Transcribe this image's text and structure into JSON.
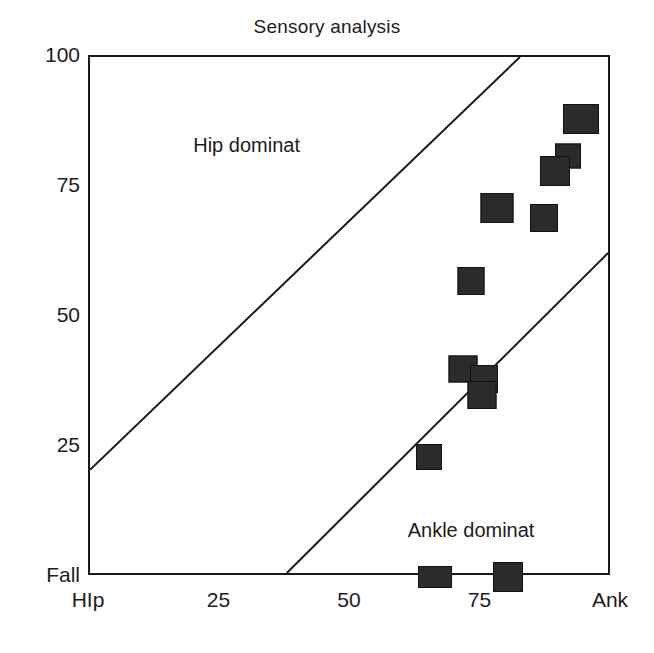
{
  "chart_data": {
    "type": "scatter",
    "title": "Sensory analysis",
    "xlabel": "",
    "ylabel": "",
    "xlim": [
      0,
      100
    ],
    "ylim": [
      0,
      100
    ],
    "grid": false,
    "legend": null,
    "x_tick_values": [
      0,
      25,
      50,
      75,
      100
    ],
    "x_tick_labels": [
      "HIp",
      "25",
      "50",
      "75",
      "Ank"
    ],
    "y_tick_values": [
      0,
      25,
      50,
      75,
      100
    ],
    "y_tick_labels": [
      "Fall",
      "25",
      "50",
      "75",
      "100"
    ],
    "marker_style": "filled-square",
    "marker_color": "#2b2b2b",
    "points": [
      {
        "x": 66,
        "y": 0,
        "w": 34,
        "h": 22
      },
      {
        "x": 80,
        "y": 0,
        "w": 30,
        "h": 30
      },
      {
        "x": 65,
        "y": 23,
        "w": 26,
        "h": 26
      },
      {
        "x": 71.5,
        "y": 40,
        "w": 29,
        "h": 27
      },
      {
        "x": 75.5,
        "y": 38,
        "w": 28,
        "h": 28
      },
      {
        "x": 75,
        "y": 35,
        "w": 29,
        "h": 28
      },
      {
        "x": 73,
        "y": 57,
        "w": 27,
        "h": 28
      },
      {
        "x": 78,
        "y": 71,
        "w": 33,
        "h": 30
      },
      {
        "x": 87,
        "y": 69,
        "w": 28,
        "h": 28
      },
      {
        "x": 91.5,
        "y": 81,
        "w": 26,
        "h": 25
      },
      {
        "x": 89,
        "y": 78,
        "w": 30,
        "h": 30
      },
      {
        "x": 94,
        "y": 88,
        "w": 36,
        "h": 30
      }
    ],
    "boundary_lines": [
      {
        "name": "hip-boundary",
        "x1": 0,
        "y1": 20,
        "x2": 83,
        "y2": 100
      },
      {
        "name": "ankle-boundary",
        "x1": 38,
        "y1": 0,
        "x2": 100,
        "y2": 62
      }
    ],
    "annotations": [
      {
        "name": "hip-dominat-label",
        "text": "Hip dominat",
        "x": 30,
        "y": 83
      },
      {
        "name": "ankle-dominat-label",
        "text": "Ankle dominat",
        "x": 73,
        "y": 9
      }
    ]
  }
}
